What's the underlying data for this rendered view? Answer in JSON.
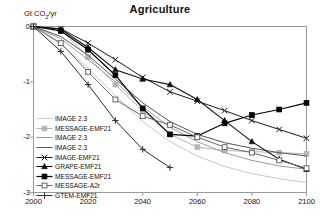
{
  "chart_data": {
    "type": "line",
    "title": "Agriculture",
    "ylabel": "Gt CO2/yr",
    "ylabel_rich": {
      "pre": "Gt CO",
      "sub": "2",
      "post": "/yr"
    },
    "xlabel": "",
    "xlim": [
      2000,
      2100
    ],
    "ylim": [
      -3,
      0
    ],
    "xticks": [
      2000,
      2020,
      2040,
      2060,
      2080,
      2100
    ],
    "yticks": [
      0,
      -1,
      -2,
      -3
    ],
    "xticklabels": [
      "2000",
      "2020",
      "2040",
      "2060",
      "2080",
      "2100"
    ],
    "yticklabels": [
      "0",
      "-1",
      "-2",
      "-3"
    ],
    "grid": false,
    "legend_position": "lower-left",
    "series": [
      {
        "name": "IMAGE 2.3",
        "color": "#c9c9c9",
        "marker": "none",
        "width": 1.0,
        "x": [
          2000,
          2010,
          2020,
          2030,
          2040,
          2050,
          2060,
          2070,
          2080,
          2090,
          2100
        ],
        "y": [
          0.0,
          -0.32,
          -0.75,
          -1.25,
          -1.72,
          -2.08,
          -2.34,
          -2.53,
          -2.66,
          -2.75,
          -2.82
        ]
      },
      {
        "name": "MESSAGE-EMF21",
        "color": "#b5b5b5",
        "marker": "square-filled",
        "width": 1.0,
        "x": [
          2000,
          2010,
          2020,
          2030,
          2040,
          2050,
          2060,
          2070,
          2080,
          2090,
          2100
        ],
        "y": [
          0.0,
          -0.05,
          -0.55,
          -1.05,
          -1.52,
          -1.95,
          -2.18,
          -2.24,
          -2.26,
          -2.28,
          -2.3
        ]
      },
      {
        "name": "IMAGE 2.3",
        "color": "#9a9a9a",
        "marker": "none",
        "width": 1.0,
        "x": [
          2000,
          2010,
          2020,
          2030,
          2040,
          2050,
          2060,
          2070,
          2080,
          2090,
          2100
        ],
        "y": [
          0.0,
          -0.22,
          -0.6,
          -1.0,
          -1.45,
          -1.82,
          -2.08,
          -2.28,
          -2.42,
          -2.52,
          -2.58
        ]
      },
      {
        "name": "IMAGE 2.3",
        "color": "#555555",
        "marker": "none",
        "width": 1.0,
        "x": [
          2000,
          2010,
          2020,
          2030,
          2040,
          2050,
          2060,
          2070,
          2080,
          2090,
          2100
        ],
        "y": [
          0.0,
          -0.18,
          -0.52,
          -0.95,
          -1.38,
          -1.72,
          -1.95,
          -2.1,
          -2.2,
          -2.28,
          -2.34
        ]
      },
      {
        "name": "IMAGE-EMF21",
        "color": "#1a1a1a",
        "marker": "x-cross",
        "width": 1.0,
        "x": [
          2000,
          2010,
          2020,
          2030,
          2040,
          2050,
          2060,
          2070,
          2080,
          2090,
          2100
        ],
        "y": [
          0.0,
          -0.04,
          -0.3,
          -0.6,
          -0.92,
          -1.18,
          -1.35,
          -1.52,
          -1.7,
          -1.86,
          -2.02
        ]
      },
      {
        "name": "GRAPE-EMF21",
        "color": "#111111",
        "marker": "triangle-filled",
        "width": 1.1,
        "x": [
          2000,
          2010,
          2020,
          2030,
          2040,
          2050,
          2060,
          2070,
          2080,
          2090,
          2100
        ],
        "y": [
          0.0,
          -0.05,
          -0.38,
          -0.78,
          -0.95,
          -1.05,
          -1.32,
          -1.7,
          -2.08,
          -2.4,
          -2.58
        ]
      },
      {
        "name": "MESSAGE-EMF21",
        "color": "#000000",
        "marker": "square-filled",
        "width": 1.2,
        "x": [
          2000,
          2010,
          2020,
          2030,
          2040,
          2050,
          2060,
          2070,
          2080,
          2090,
          2100
        ],
        "y": [
          0.0,
          -0.08,
          -0.42,
          -0.88,
          -1.48,
          -1.95,
          -1.98,
          -1.75,
          -1.6,
          -1.5,
          -1.38
        ]
      },
      {
        "name": "MESSAGE-A2r",
        "color": "#666666",
        "marker": "square-open",
        "width": 1.0,
        "x": [
          2000,
          2010,
          2020,
          2030,
          2040,
          2050,
          2060,
          2070,
          2080,
          2090,
          2100
        ],
        "y": [
          0.0,
          -0.3,
          -0.82,
          -1.32,
          -1.62,
          -1.78,
          -2.0,
          -2.18,
          -2.28,
          -2.42,
          -2.56
        ]
      },
      {
        "name": "GTEM-EMF21",
        "color": "#2a2a2a",
        "marker": "plus",
        "width": 1.0,
        "x": [
          2000,
          2010,
          2020,
          2030,
          2040,
          2050
        ],
        "y": [
          0.0,
          -0.45,
          -1.05,
          -1.7,
          -2.22,
          -2.55
        ]
      }
    ]
  },
  "legend": {
    "entries": [
      {
        "label": "IMAGE 2.3"
      },
      {
        "label": "MESSAGE-EMF21"
      },
      {
        "label": "IMAGE 2.3"
      },
      {
        "label": "IMAGE 2.3"
      },
      {
        "label": "IMAGE-EMF21"
      },
      {
        "label": "GRAPE-EMF21"
      },
      {
        "label": "MESSAGE-EMF21"
      },
      {
        "label": "MESSAGE-A2r"
      },
      {
        "label": "GTEM-EMF21"
      }
    ]
  },
  "axis_color": "#9a9a9a",
  "text_color": "#111111"
}
